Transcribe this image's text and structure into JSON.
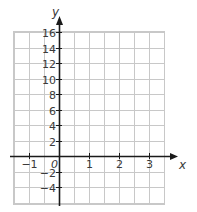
{
  "graph": {
    "x_axis_label": "x",
    "y_axis_label": "y",
    "origin_label": "0",
    "x_range": [
      -1.5,
      3.5
    ],
    "y_range": [
      -6,
      17
    ],
    "x_ticks": [
      {
        "value": -1,
        "label": "−1"
      },
      {
        "value": 1,
        "label": "1"
      },
      {
        "value": 2,
        "label": "2"
      },
      {
        "value": 3,
        "label": "3"
      }
    ],
    "y_ticks": [
      {
        "value": 16,
        "label": "16"
      },
      {
        "value": 14,
        "label": "14"
      },
      {
        "value": 12,
        "label": "12"
      },
      {
        "value": 10,
        "label": "10"
      },
      {
        "value": 8,
        "label": "8"
      },
      {
        "value": 6,
        "label": "6"
      },
      {
        "value": 4,
        "label": "4"
      },
      {
        "value": 2,
        "label": "2"
      },
      {
        "value": -2,
        "label": "−2"
      },
      {
        "value": -4,
        "label": "−4"
      }
    ],
    "x_grid_step": 0.5,
    "y_grid_step": 2,
    "grid_color": "#c8c8c8",
    "axis_color": "#1a1a1a"
  }
}
